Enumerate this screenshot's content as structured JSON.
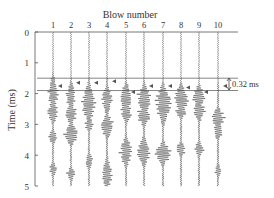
{
  "chart_data": {
    "type": "seismic-waveform",
    "title": "Blow number",
    "xlabel": "Blow number",
    "ylabel": "Time (ms)",
    "x_ticks": [
      "1",
      "2",
      "3",
      "4",
      "5",
      "6",
      "7",
      "8",
      "9",
      "10"
    ],
    "y_ticks": [
      "0",
      "1",
      "2",
      "3",
      "4",
      "5"
    ],
    "ylim": [
      0,
      5
    ],
    "y_inverted": true,
    "reference_lines_ms": [
      1.5,
      1.9
    ],
    "annotation": "0.32 ms",
    "first_arrivals_ms": [
      1.75,
      1.65,
      1.65,
      1.6,
      1.95,
      1.75,
      1.75,
      1.8,
      1.95,
      1.75
    ],
    "traces": [
      {
        "blow": 1,
        "bursts": [
          [
            2.0,
            0.5,
            6
          ],
          [
            2.6,
            0.3,
            7
          ],
          [
            3.4,
            0.2,
            5
          ],
          [
            4.45,
            0.2,
            5
          ]
        ]
      },
      {
        "blow": 2,
        "bursts": [
          [
            2.1,
            0.4,
            6
          ],
          [
            2.65,
            0.3,
            7
          ],
          [
            3.3,
            0.3,
            9
          ],
          [
            4.6,
            0.2,
            5
          ]
        ]
      },
      {
        "blow": 3,
        "bursts": [
          [
            2.3,
            0.5,
            9
          ],
          [
            3.0,
            0.2,
            5
          ],
          [
            4.2,
            0.25,
            5
          ]
        ]
      },
      {
        "blow": 4,
        "bursts": [
          [
            2.2,
            0.4,
            6
          ],
          [
            3.05,
            0.3,
            9
          ],
          [
            4.6,
            0.4,
            7
          ]
        ]
      },
      {
        "blow": 5,
        "bursts": [
          [
            2.15,
            0.4,
            8
          ],
          [
            2.6,
            0.3,
            7
          ],
          [
            3.9,
            0.4,
            8
          ]
        ]
      },
      {
        "blow": 6,
        "bursts": [
          [
            2.2,
            0.4,
            9
          ],
          [
            2.7,
            0.3,
            8
          ],
          [
            3.9,
            0.4,
            8
          ]
        ]
      },
      {
        "blow": 7,
        "bursts": [
          [
            2.35,
            0.5,
            10
          ],
          [
            3.95,
            0.3,
            10
          ]
        ]
      },
      {
        "blow": 8,
        "bursts": [
          [
            2.2,
            0.4,
            9
          ],
          [
            2.6,
            0.2,
            6
          ],
          [
            3.8,
            0.2,
            6
          ]
        ]
      },
      {
        "blow": 9,
        "bursts": [
          [
            2.1,
            0.3,
            8
          ],
          [
            2.55,
            0.3,
            7
          ],
          [
            3.8,
            0.2,
            6
          ]
        ]
      },
      {
        "blow": 10,
        "bursts": [
          [
            2.8,
            0.3,
            8
          ],
          [
            3.2,
            0.25,
            6
          ],
          [
            4.5,
            0.2,
            4
          ]
        ]
      }
    ]
  }
}
